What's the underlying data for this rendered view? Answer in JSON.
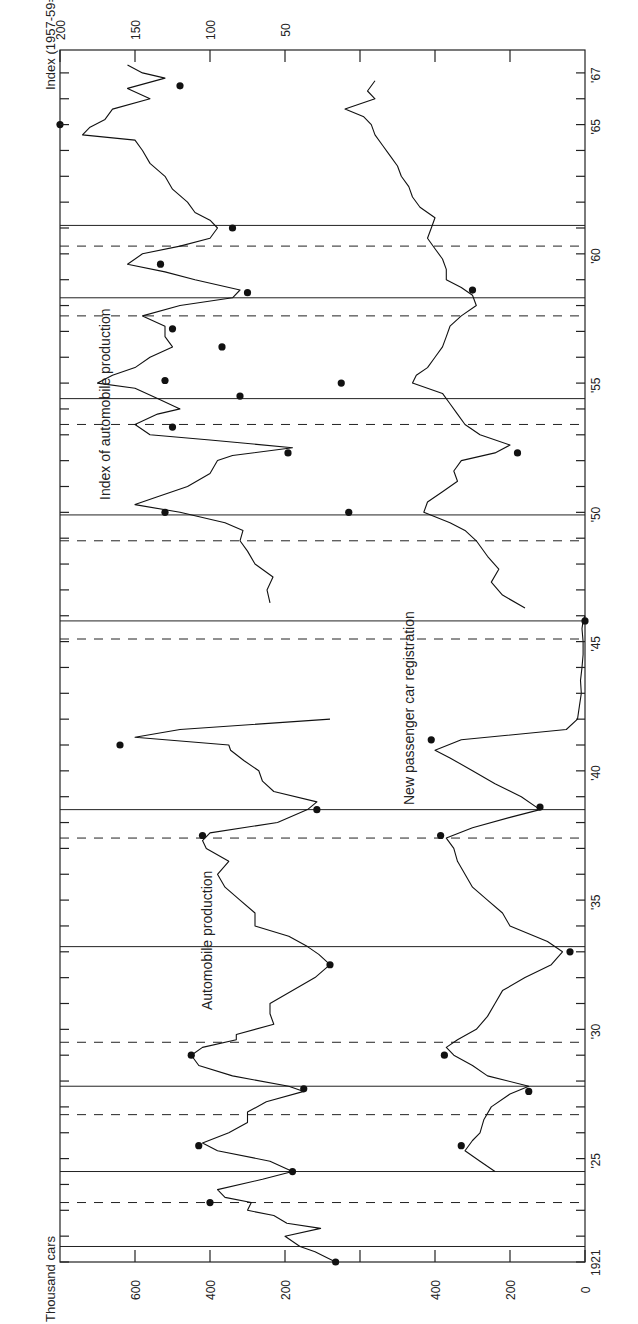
{
  "chart_data": {
    "type": "line",
    "orientation": "rotated 90 degrees counter-clockwise (time axis runs bottom-to-top)",
    "title": "",
    "xlabel": "Year",
    "x_ticks": [
      "1921",
      "'25",
      "'30",
      "'35",
      "'40",
      "'45",
      "'50",
      "'55",
      "'60",
      "'65",
      "'67"
    ],
    "x_range": [
      1920.5,
      1967.5
    ],
    "left_axis": {
      "label": "Thousand cars",
      "panels": [
        {
          "name": "Automobile production",
          "ticks": [
            600,
            400,
            200
          ],
          "zero_baseline": true
        },
        {
          "name": "New passenger car registration",
          "ticks": [
            400,
            200,
            0
          ]
        }
      ]
    },
    "right_axis": {
      "label": "Index (1957-59=100)",
      "ticks": [
        200,
        150,
        100,
        50
      ]
    },
    "annotations": [
      "Automobile production",
      "New passenger car registration",
      "Index of automobile production"
    ],
    "reference_lines": {
      "solid_troughs": [
        1921.6,
        1924.5,
        1927.8,
        1933.2,
        1938.5,
        1945.8,
        1949.9,
        1954.4,
        1958.3,
        1961.1
      ],
      "dashed_peaks": [
        1923.3,
        1926.7,
        1929.5,
        1937.4,
        1945.1,
        1948.9,
        1953.4,
        1957.6,
        1960.3
      ]
    },
    "series": [
      {
        "name": "Automobile production",
        "unit": "thousand cars",
        "x": [
          1921.0,
          1921.4,
          1921.6,
          1922.0,
          1922.3,
          1922.5,
          1922.8,
          1923.0,
          1923.3,
          1923.5,
          1923.8,
          1924.2,
          1924.5,
          1924.9,
          1925.3,
          1925.6,
          1926.0,
          1926.4,
          1926.8,
          1927.2,
          1927.6,
          1927.8,
          1928.2,
          1928.6,
          1929.0,
          1929.3,
          1929.6,
          1929.8,
          1930.2,
          1930.6,
          1931.0,
          1931.5,
          1932.0,
          1932.5,
          1932.9,
          1933.2,
          1933.6,
          1934.0,
          1934.5,
          1935.0,
          1935.5,
          1936.0,
          1936.5,
          1937.0,
          1937.3,
          1937.6,
          1938.0,
          1938.5,
          1938.8,
          1939.2,
          1939.6,
          1940.0,
          1940.4,
          1940.8,
          1941.0,
          1941.3,
          1941.6,
          1942.0
        ],
        "y": [
          65,
          120,
          160,
          200,
          105,
          195,
          230,
          300,
          290,
          360,
          380,
          260,
          180,
          240,
          380,
          420,
          350,
          300,
          300,
          250,
          150,
          190,
          340,
          430,
          450,
          420,
          330,
          330,
          230,
          240,
          240,
          180,
          120,
          80,
          110,
          140,
          190,
          280,
          280,
          320,
          360,
          380,
          350,
          410,
          420,
          400,
          220,
          140,
          115,
          230,
          260,
          270,
          310,
          345,
          350,
          600,
          480,
          80
        ]
      },
      {
        "name": "New passenger car registration",
        "unit": "thousand cars",
        "x": [
          1924.5,
          1924.9,
          1925.3,
          1925.7,
          1926.0,
          1926.5,
          1927.0,
          1927.5,
          1927.8,
          1928.2,
          1928.6,
          1929.0,
          1929.3,
          1929.6,
          1930.0,
          1930.5,
          1931.0,
          1931.5,
          1932.0,
          1932.5,
          1933.0,
          1933.4,
          1934.0,
          1934.5,
          1935.0,
          1935.5,
          1936.0,
          1936.5,
          1937.0,
          1937.4,
          1937.8,
          1938.2,
          1938.5,
          1939.0,
          1939.5,
          1940.0,
          1940.5,
          1940.8,
          1941.2,
          1941.6,
          1942.0,
          1942.5,
          1943.0,
          1943.5,
          1944.0,
          1944.5,
          1945.0,
          1945.5,
          1945.8,
          1946.0
        ],
        "y": [
          240,
          280,
          320,
          300,
          280,
          270,
          250,
          200,
          150,
          260,
          300,
          350,
          370,
          340,
          290,
          260,
          240,
          220,
          160,
          90,
          60,
          100,
          200,
          220,
          260,
          300,
          320,
          340,
          350,
          370,
          300,
          200,
          120,
          170,
          240,
          300,
          360,
          400,
          330,
          50,
          20,
          15,
          10,
          12,
          8,
          5,
          5,
          8,
          5,
          0
        ]
      },
      {
        "name": "Index of automobile production",
        "unit": "index 1957-59=100",
        "x": [
          1946.5,
          1947.0,
          1947.5,
          1948.0,
          1948.5,
          1948.9,
          1949.3,
          1949.6,
          1950.0,
          1950.3,
          1950.6,
          1951.0,
          1951.5,
          1952.0,
          1952.2,
          1952.5,
          1952.8,
          1953.0,
          1953.4,
          1953.8,
          1954.0,
          1954.4,
          1954.8,
          1955.0,
          1955.3,
          1955.6,
          1956.0,
          1956.4,
          1956.8,
          1957.2,
          1957.6,
          1958.0,
          1958.3,
          1958.6,
          1959.0,
          1959.3,
          1959.6,
          1960.0,
          1960.3,
          1960.6,
          1961.0,
          1961.3,
          1961.6,
          1962.0,
          1962.5,
          1963.0,
          1963.5,
          1964.0,
          1964.4,
          1964.6,
          1964.9,
          1965.2,
          1965.6,
          1966.0,
          1966.4,
          1966.8,
          1967.0,
          1967.3
        ],
        "y": [
          60,
          62,
          58,
          70,
          75,
          80,
          78,
          90,
          120,
          150,
          135,
          115,
          100,
          95,
          85,
          45,
          100,
          140,
          150,
          135,
          120,
          135,
          150,
          175,
          165,
          150,
          140,
          125,
          130,
          130,
          145,
          120,
          85,
          80,
          110,
          130,
          155,
          145,
          120,
          100,
          95,
          100,
          110,
          115,
          125,
          130,
          140,
          145,
          150,
          185,
          180,
          170,
          165,
          140,
          155,
          130,
          145,
          155
        ]
      },
      {
        "name": "New passenger car registration (postwar)",
        "unit": "thousand cars",
        "x": [
          1946.3,
          1946.8,
          1947.3,
          1947.8,
          1948.3,
          1948.9,
          1949.3,
          1949.6,
          1950.0,
          1950.4,
          1950.8,
          1951.2,
          1951.6,
          1952.0,
          1952.3,
          1952.6,
          1953.0,
          1953.4,
          1953.8,
          1954.2,
          1954.6,
          1955.0,
          1955.3,
          1955.6,
          1956.0,
          1956.4,
          1956.8,
          1957.2,
          1957.6,
          1958.0,
          1958.4,
          1958.7,
          1959.0,
          1959.4,
          1959.8,
          1960.2,
          1960.6,
          1961.0,
          1961.4,
          1961.8,
          1962.2,
          1962.6,
          1963.0,
          1963.4,
          1963.8,
          1964.2,
          1964.6,
          1965.0,
          1965.3,
          1965.6,
          1966.0,
          1966.3,
          1966.7
        ],
        "y": [
          160,
          220,
          250,
          230,
          260,
          290,
          320,
          360,
          430,
          420,
          380,
          340,
          350,
          330,
          240,
          200,
          280,
          320,
          340,
          360,
          380,
          460,
          450,
          420,
          400,
          380,
          370,
          360,
          330,
          290,
          300,
          330,
          370,
          370,
          380,
          400,
          420,
          410,
          400,
          440,
          460,
          470,
          490,
          500,
          520,
          540,
          560,
          570,
          590,
          640,
          560,
          580,
          560
        ]
      }
    ],
    "markers": {
      "automobile_production": [
        [
          1921.0,
          65
        ],
        [
          1923.3,
          400
        ],
        [
          1924.5,
          180
        ],
        [
          1925.5,
          430
        ],
        [
          1927.7,
          150
        ],
        [
          1929.0,
          450
        ],
        [
          1932.5,
          80
        ],
        [
          1937.5,
          420
        ],
        [
          1938.5,
          115
        ],
        [
          1941.0,
          640
        ]
      ],
      "registration": [
        [
          1925.5,
          330
        ],
        [
          1927.6,
          150
        ],
        [
          1929.0,
          375
        ],
        [
          1933.0,
          40
        ],
        [
          1937.5,
          385
        ],
        [
          1938.6,
          120
        ],
        [
          1941.2,
          410
        ],
        [
          1945.8,
          0
        ]
      ],
      "index": [
        [
          1950.0,
          130
        ],
        [
          1952.3,
          48
        ],
        [
          1953.3,
          125
        ],
        [
          1954.5,
          80
        ],
        [
          1955.1,
          130
        ],
        [
          1956.4,
          92
        ],
        [
          1957.1,
          125
        ],
        [
          1958.5,
          75
        ],
        [
          1959.6,
          133
        ],
        [
          1961.0,
          85
        ],
        [
          1965.0,
          200
        ],
        [
          1966.5,
          120
        ]
      ],
      "registration_postwar": [
        [
          1950.0,
          630
        ],
        [
          1952.3,
          180
        ],
        [
          1955.0,
          650
        ],
        [
          1958.6,
          300
        ]
      ]
    },
    "labels": {
      "thousand_cars": "Thousand cars",
      "index_axis": "Index (1957-59=100)",
      "auto_production": "Automobile production",
      "new_registration": "New passenger car registration",
      "index_production": "Index of automobile production"
    }
  }
}
